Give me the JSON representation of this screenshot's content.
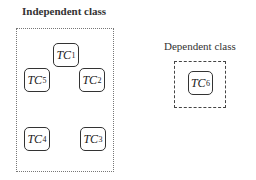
{
  "diagram": {
    "independent_group": {
      "title": "Independent class",
      "border_style": "dotted",
      "nodes": [
        {
          "id": "TC1",
          "base": "TC",
          "sub": "1"
        },
        {
          "id": "TC5",
          "base": "TC",
          "sub": "5"
        },
        {
          "id": "TC2",
          "base": "TC",
          "sub": "2"
        },
        {
          "id": "TC4",
          "base": "TC",
          "sub": "4"
        },
        {
          "id": "TC3",
          "base": "TC",
          "sub": "3"
        }
      ]
    },
    "dependent_group": {
      "title": "Dependent class",
      "border_style": "dashed",
      "nodes": [
        {
          "id": "TC6",
          "base": "TC",
          "sub": "6"
        }
      ]
    },
    "colors": {
      "stroke": "#333333",
      "background": "#ffffff"
    }
  }
}
